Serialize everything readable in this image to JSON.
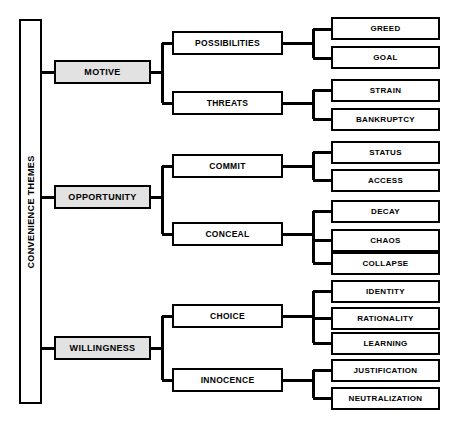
{
  "diagram": {
    "colors": {
      "line": "#000000",
      "level1_fill": "#e2e2e2",
      "box_fill": "#ffffff",
      "text": "#000000"
    },
    "root": {
      "label": "CONVENIENCE THEMES",
      "orientation": "vertical"
    },
    "level1": [
      {
        "id": "motive",
        "label": "MOTIVE"
      },
      {
        "id": "opportunity",
        "label": "OPPORTUNITY"
      },
      {
        "id": "willingness",
        "label": "WILLINGNESS"
      }
    ],
    "level2": [
      {
        "id": "possibilities",
        "label": "POSSIBILITIES",
        "parent": "motive"
      },
      {
        "id": "threats",
        "label": "THREATS",
        "parent": "motive"
      },
      {
        "id": "commit",
        "label": "COMMIT",
        "parent": "opportunity"
      },
      {
        "id": "conceal",
        "label": "CONCEAL",
        "parent": "opportunity"
      },
      {
        "id": "choice",
        "label": "CHOICE",
        "parent": "willingness"
      },
      {
        "id": "innocence",
        "label": "INNOCENCE",
        "parent": "willingness"
      }
    ],
    "leaves": [
      {
        "id": "greed",
        "label": "GREED",
        "parent": "possibilities"
      },
      {
        "id": "goal",
        "label": "GOAL",
        "parent": "possibilities"
      },
      {
        "id": "strain",
        "label": "STRAIN",
        "parent": "threats"
      },
      {
        "id": "bankruptcy",
        "label": "BANKRUPTCY",
        "parent": "threats"
      },
      {
        "id": "status",
        "label": "STATUS",
        "parent": "commit"
      },
      {
        "id": "access",
        "label": "ACCESS",
        "parent": "commit"
      },
      {
        "id": "decay",
        "label": "DECAY",
        "parent": "conceal"
      },
      {
        "id": "chaos",
        "label": "CHAOS",
        "parent": "conceal"
      },
      {
        "id": "collapse",
        "label": "COLLAPSE",
        "parent": "conceal"
      },
      {
        "id": "identity",
        "label": "IDENTITY",
        "parent": "choice"
      },
      {
        "id": "rationality",
        "label": "RATIONALITY",
        "parent": "choice"
      },
      {
        "id": "learning",
        "label": "LEARNING",
        "parent": "choice"
      },
      {
        "id": "justification",
        "label": "JUSTIFICATION",
        "parent": "innocence"
      },
      {
        "id": "neutralization",
        "label": "NEUTRALIZATION",
        "parent": "innocence"
      }
    ]
  }
}
